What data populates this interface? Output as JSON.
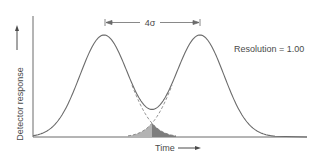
{
  "chart_data": {
    "type": "line",
    "title": "",
    "xlabel": "Time",
    "ylabel": "Detector response",
    "annotation": "Resolution = 1.00",
    "separation_label": "4σ",
    "grid": false,
    "legend": null,
    "series": [
      {
        "name": "Peak 1",
        "center": 0,
        "sigma": 1,
        "height": 1
      },
      {
        "name": "Peak 2",
        "center": 4,
        "sigma": 1,
        "height": 1
      },
      {
        "name": "Combined response",
        "values": "sum of Peak 1 and Peak 2"
      }
    ],
    "peak_separation_sigma": 4,
    "resolution": 1.0,
    "overlap_shaded": true
  },
  "colors": {
    "curve": "#6b6b6b",
    "axis": "#6b6b6b",
    "overlap_left": "#a9a9a9",
    "overlap_right": "#7a7a7a",
    "text": "#4a4a4a"
  }
}
